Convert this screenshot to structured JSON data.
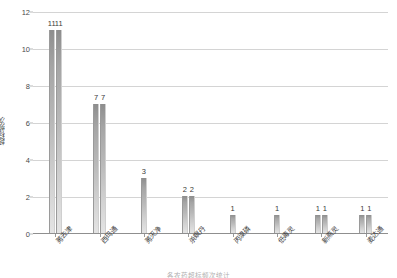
{
  "chart_data": {
    "type": "bar",
    "title": "",
    "xlabel": "",
    "ylabel": "超标频次",
    "ylim": [
      0,
      12
    ],
    "yticks": [
      "0",
      "2",
      "4",
      "6",
      "8",
      "10",
      "12"
    ],
    "grid": true,
    "legend": "none",
    "categories": [
      "莠去津",
      "西玛通",
      "莠灭净",
      "杀螟丹",
      "丙溴磷",
      "低毒灵",
      "新燕灵",
      "麦overline"
    ],
    "groups": [
      {
        "label": "莠去津",
        "bars": [
          {
            "value": 11,
            "label": "11"
          },
          {
            "value": 11,
            "label": "11"
          }
        ]
      },
      {
        "label": "西玛通",
        "bars": [
          {
            "value": 7,
            "label": "7"
          },
          {
            "value": 7,
            "label": "7"
          }
        ]
      },
      {
        "label": "莠灭净",
        "bars": [
          {
            "value": 3,
            "label": "3"
          }
        ]
      },
      {
        "label": "杀螟丹",
        "bars": [
          {
            "value": 2,
            "label": "2"
          },
          {
            "value": 2,
            "label": "2"
          }
        ]
      },
      {
        "label": "丙溴磷",
        "bars": [
          {
            "value": 1,
            "label": "1"
          }
        ]
      },
      {
        "label": "低毒灵",
        "bars": [
          {
            "value": 1,
            "label": "1"
          }
        ]
      },
      {
        "label": "新燕灵",
        "bars": [
          {
            "value": 1,
            "label": "1"
          },
          {
            "value": 1,
            "label": "1"
          }
        ]
      },
      {
        "label": "麦达通",
        "bars": [
          {
            "value": 1,
            "label": "1"
          },
          {
            "value": 1,
            "label": "1"
          }
        ]
      }
    ],
    "caption": "各农药超标频次统计",
    "colors": {
      "bar_top": "#8d8d8d",
      "bar_bottom": "#e4e4e4",
      "gridline": "#d4d4d4",
      "axis": "#8f8f8f",
      "text": "#3b3b3b",
      "background": "#ffffff"
    }
  }
}
